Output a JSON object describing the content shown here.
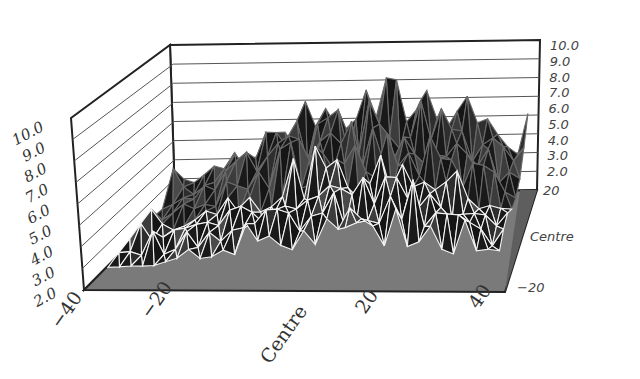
{
  "chart_data": {
    "type": "surface3d",
    "title": "",
    "z_axis": {
      "label": "",
      "range": [
        2.0,
        10.0
      ],
      "ticks_left": [
        "2.0",
        "3.0",
        "4.0",
        "5.0",
        "6.0",
        "7.0",
        "8.0",
        "9.0",
        "10.0"
      ],
      "ticks_right": [
        "2.0",
        "3.0",
        "4.0",
        "5.0",
        "6.0",
        "7.0",
        "8.0",
        "9.0",
        "10.0"
      ]
    },
    "x_axis": {
      "label": "",
      "range": [
        -40,
        40
      ],
      "ticks": [
        "-40",
        "-20",
        "Centre",
        "20",
        "40"
      ]
    },
    "y_axis": {
      "label": "",
      "range": [
        -20,
        20
      ],
      "ticks": [
        "-20",
        "Centre",
        "20"
      ]
    },
    "grid": true,
    "legend": null,
    "profile_x": [
      -40,
      -30,
      -20,
      -10,
      0,
      10,
      20,
      30,
      40
    ],
    "profile_max_z": [
      3.2,
      4.0,
      6.0,
      7.2,
      8.2,
      8.4,
      8.8,
      6.5,
      5.0
    ]
  },
  "colors": {
    "floor": "#7a7a7a",
    "surface": "#1c1c1c",
    "mesh": "#ffffff",
    "walls": "#ffffff",
    "gridline": "#555555"
  }
}
